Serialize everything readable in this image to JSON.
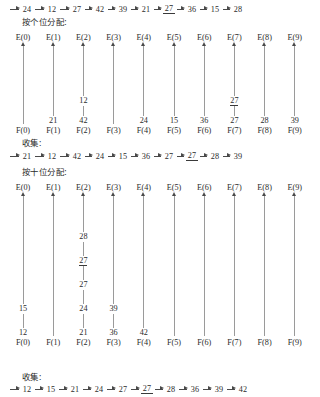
{
  "figure": {
    "bucket_labels_head": [
      "E(0)",
      "E(1)",
      "E(2)",
      "E(3)",
      "E(4)",
      "E(5)",
      "E(6)",
      "E(7)",
      "E(8)",
      "E(9)"
    ],
    "bucket_labels_tail": [
      "F(0)",
      "F(1)",
      "F(2)",
      "F(3)",
      "F(4)",
      "F(5)",
      "F(6)",
      "F(7)",
      "F(8)",
      "F(9)"
    ]
  },
  "captions": {
    "pass1_distribute": "按个位分配:",
    "collect1": "收集:",
    "pass2_distribute": "按十位分配:",
    "collect2": "收集:"
  },
  "sequences": {
    "initial": {
      "name": "initial-list",
      "items": [
        {
          "value": "24",
          "marked": false
        },
        {
          "value": "12",
          "marked": false
        },
        {
          "value": "27",
          "marked": false
        },
        {
          "value": "42",
          "marked": false
        },
        {
          "value": "39",
          "marked": false
        },
        {
          "value": "21",
          "marked": false
        },
        {
          "value": "27",
          "marked": true
        },
        {
          "value": "36",
          "marked": false
        },
        {
          "value": "15",
          "marked": false
        },
        {
          "value": "28",
          "marked": false
        }
      ]
    },
    "after_pass1": {
      "name": "list-after-ones-pass",
      "items": [
        {
          "value": "21",
          "marked": false
        },
        {
          "value": "12",
          "marked": false
        },
        {
          "value": "42",
          "marked": false
        },
        {
          "value": "24",
          "marked": false
        },
        {
          "value": "15",
          "marked": false
        },
        {
          "value": "36",
          "marked": false
        },
        {
          "value": "27",
          "marked": false
        },
        {
          "value": "27",
          "marked": true
        },
        {
          "value": "28",
          "marked": false
        },
        {
          "value": "39",
          "marked": false
        }
      ]
    },
    "after_pass2": {
      "name": "list-after-tens-pass",
      "items": [
        {
          "value": "12",
          "marked": false
        },
        {
          "value": "15",
          "marked": false
        },
        {
          "value": "21",
          "marked": false
        },
        {
          "value": "24",
          "marked": false
        },
        {
          "value": "27",
          "marked": false
        },
        {
          "value": "27",
          "marked": true
        },
        {
          "value": "28",
          "marked": false
        },
        {
          "value": "36",
          "marked": false
        },
        {
          "value": "39",
          "marked": false
        },
        {
          "value": "42",
          "marked": false
        }
      ]
    }
  },
  "pass1_buckets": [
    {
      "index": 0,
      "head": "E(0)",
      "tail": "F(0)",
      "nodes": []
    },
    {
      "index": 1,
      "head": "E(1)",
      "tail": "F(1)",
      "nodes": [
        {
          "value": "21",
          "marked": false
        }
      ]
    },
    {
      "index": 2,
      "head": "E(2)",
      "tail": "F(2)",
      "nodes": [
        {
          "value": "12",
          "marked": false
        },
        {
          "value": "42",
          "marked": false
        }
      ]
    },
    {
      "index": 3,
      "head": "E(3)",
      "tail": "F(3)",
      "nodes": []
    },
    {
      "index": 4,
      "head": "E(4)",
      "tail": "F(4)",
      "nodes": [
        {
          "value": "24",
          "marked": false
        }
      ]
    },
    {
      "index": 5,
      "head": "E(5)",
      "tail": "F(5)",
      "nodes": [
        {
          "value": "15",
          "marked": false
        }
      ]
    },
    {
      "index": 6,
      "head": "E(6)",
      "tail": "F(6)",
      "nodes": [
        {
          "value": "36",
          "marked": false
        }
      ]
    },
    {
      "index": 7,
      "head": "E(7)",
      "tail": "F(7)",
      "nodes": [
        {
          "value": "27",
          "marked": true
        },
        {
          "value": "27",
          "marked": false
        }
      ]
    },
    {
      "index": 8,
      "head": "E(8)",
      "tail": "F(8)",
      "nodes": [
        {
          "value": "28",
          "marked": false
        }
      ]
    },
    {
      "index": 9,
      "head": "E(9)",
      "tail": "F(9)",
      "nodes": [
        {
          "value": "39",
          "marked": false
        }
      ]
    }
  ],
  "pass2_buckets": [
    {
      "index": 0,
      "head": "E(0)",
      "tail": "F(0)",
      "nodes": [
        {
          "value": "15",
          "marked": false
        },
        {
          "value": "12",
          "marked": false
        }
      ]
    },
    {
      "index": 1,
      "head": "E(1)",
      "tail": "F(1)",
      "nodes": []
    },
    {
      "index": 2,
      "head": "E(2)",
      "tail": "F(2)",
      "nodes": [
        {
          "value": "28",
          "marked": false
        },
        {
          "value": "27",
          "marked": true
        },
        {
          "value": "27",
          "marked": false
        },
        {
          "value": "24",
          "marked": false
        },
        {
          "value": "21",
          "marked": false
        }
      ]
    },
    {
      "index": 3,
      "head": "E(3)",
      "tail": "F(3)",
      "nodes": [
        {
          "value": "39",
          "marked": false
        },
        {
          "value": "36",
          "marked": false
        }
      ]
    },
    {
      "index": 4,
      "head": "E(4)",
      "tail": "F(4)",
      "nodes": [
        {
          "value": "42",
          "marked": false
        }
      ]
    },
    {
      "index": 5,
      "head": "E(5)",
      "tail": "F(5)",
      "nodes": []
    },
    {
      "index": 6,
      "head": "E(6)",
      "tail": "F(6)",
      "nodes": []
    },
    {
      "index": 7,
      "head": "E(7)",
      "tail": "F(7)",
      "nodes": []
    },
    {
      "index": 8,
      "head": "E(8)",
      "tail": "F(8)",
      "nodes": []
    },
    {
      "index": 9,
      "head": "E(9)",
      "tail": "F(9)",
      "nodes": []
    }
  ],
  "layout": {
    "bucket_left_start": 8,
    "bucket_pitch": 30.2
  },
  "colors": {
    "ink": "#2b2b2b",
    "line": "#9a9a9a",
    "arrow": "#4a4a4a",
    "background": "#ffffff"
  }
}
